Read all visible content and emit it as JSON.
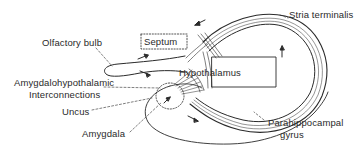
{
  "diagram": {
    "type": "anatomical-schematic",
    "labels": {
      "olfactory_bulb": "Olfactory bulb",
      "septum": "Septum",
      "stria_terminalis": "Stria terminalis",
      "hypothalamus": "Hypothalamus",
      "amygdalohypothalamic_line1": "Amygdalohypothalamic",
      "amygdalohypothalamic_line2": "Interconnections",
      "uncus": "Uncus",
      "amygdala": "Amygdala",
      "parahippocampal_line1": "Parahippocampal",
      "parahippocampal_line2": "gyrus"
    },
    "colors": {
      "line": "#2a2a2a",
      "background": "#ffffff"
    }
  }
}
